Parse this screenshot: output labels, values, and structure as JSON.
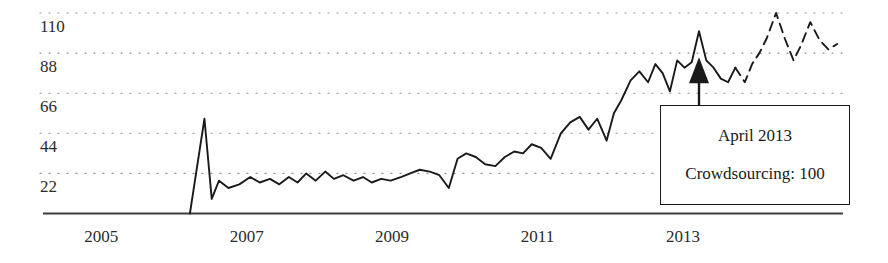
{
  "chart_data": {
    "type": "line",
    "title": "",
    "xlabel": "",
    "ylabel": "",
    "grid": true,
    "legend": null,
    "x_tick_labels": [
      "2005",
      "2007",
      "2009",
      "2011",
      "2013"
    ],
    "x_tick_values": [
      2005,
      2007,
      2009,
      2011,
      2013
    ],
    "y_tick_labels": [
      "110",
      "88",
      "66",
      "44",
      "22"
    ],
    "y_tick_values": [
      110,
      88,
      66,
      44,
      22
    ],
    "ylim": [
      0,
      110
    ],
    "xlim": [
      2004.2,
      2015.2
    ],
    "series": [
      {
        "name": "Crowdsourcing (observed)",
        "style": "solid",
        "color": "#1a1a1a",
        "points": [
          [
            2006.22,
            0
          ],
          [
            2006.42,
            52
          ],
          [
            2006.52,
            8
          ],
          [
            2006.62,
            18
          ],
          [
            2006.75,
            14
          ],
          [
            2006.9,
            16
          ],
          [
            2007.05,
            20
          ],
          [
            2007.18,
            17
          ],
          [
            2007.32,
            19
          ],
          [
            2007.45,
            16
          ],
          [
            2007.58,
            20
          ],
          [
            2007.7,
            17
          ],
          [
            2007.82,
            22
          ],
          [
            2007.95,
            18
          ],
          [
            2008.08,
            23
          ],
          [
            2008.2,
            19
          ],
          [
            2008.33,
            21
          ],
          [
            2008.47,
            18
          ],
          [
            2008.6,
            20
          ],
          [
            2008.72,
            17
          ],
          [
            2008.85,
            19
          ],
          [
            2008.98,
            18
          ],
          [
            2009.12,
            20
          ],
          [
            2009.25,
            22
          ],
          [
            2009.38,
            24
          ],
          [
            2009.52,
            23
          ],
          [
            2009.65,
            21
          ],
          [
            2009.78,
            14
          ],
          [
            2009.9,
            30
          ],
          [
            2010.02,
            33
          ],
          [
            2010.15,
            31
          ],
          [
            2010.28,
            27
          ],
          [
            2010.42,
            26
          ],
          [
            2010.55,
            31
          ],
          [
            2010.68,
            34
          ],
          [
            2010.8,
            33
          ],
          [
            2010.92,
            38
          ],
          [
            2011.05,
            36
          ],
          [
            2011.18,
            30
          ],
          [
            2011.32,
            44
          ],
          [
            2011.45,
            50
          ],
          [
            2011.58,
            53
          ],
          [
            2011.7,
            46
          ],
          [
            2011.82,
            52
          ],
          [
            2011.95,
            40
          ],
          [
            2012.05,
            55
          ],
          [
            2012.15,
            62
          ],
          [
            2012.28,
            73
          ],
          [
            2012.4,
            78
          ],
          [
            2012.52,
            72
          ],
          [
            2012.62,
            82
          ],
          [
            2012.72,
            77
          ],
          [
            2012.82,
            67
          ],
          [
            2012.92,
            84
          ],
          [
            2013.02,
            80
          ],
          [
            2013.12,
            83
          ],
          [
            2013.22,
            100
          ],
          [
            2013.32,
            84
          ],
          [
            2013.42,
            80
          ],
          [
            2013.52,
            74
          ],
          [
            2013.62,
            72
          ],
          [
            2013.72,
            80
          ]
        ]
      },
      {
        "name": "Crowdsourcing (forecast)",
        "style": "dashed",
        "color": "#1a1a1a",
        "points": [
          [
            2013.72,
            80
          ],
          [
            2013.85,
            72
          ],
          [
            2013.95,
            82
          ],
          [
            2014.05,
            88
          ],
          [
            2014.15,
            96
          ],
          [
            2014.28,
            110
          ],
          [
            2014.4,
            96
          ],
          [
            2014.52,
            84
          ],
          [
            2014.62,
            92
          ],
          [
            2014.75,
            105
          ],
          [
            2014.88,
            95
          ],
          [
            2015.0,
            90
          ],
          [
            2015.12,
            93
          ]
        ]
      }
    ],
    "annotation": {
      "date_label": "April 2013",
      "value_label": "Crowdsourcing: 100",
      "target_x": 2013.22,
      "target_y": 100,
      "arrow": "up-arrow"
    }
  },
  "axis": {
    "x_axis_name": "x-axis-line",
    "gridline_name": "horizontal-gridline"
  }
}
